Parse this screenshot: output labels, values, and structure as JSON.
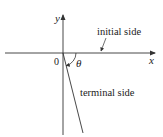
{
  "diagram": {
    "axes": {
      "x_label": "x",
      "y_label": "y",
      "origin_label": "0"
    },
    "angle_label": "θ",
    "initial_side_label": "initial side",
    "terminal_side_label": "terminal side",
    "colors": {
      "line": "#333333",
      "text": "#222222",
      "background": "#ffffff"
    }
  }
}
